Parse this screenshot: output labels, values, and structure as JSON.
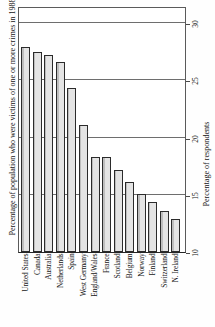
{
  "chart_data": {
    "type": "bar",
    "title": "",
    "subtitle": "",
    "categories": [
      "United States",
      "Canada",
      "Australia",
      "Netherlands",
      "Spain",
      "West Germany",
      "England/Wales",
      "France",
      "Scotland",
      "Belgium",
      "Norway",
      "Finland",
      "Switzerland",
      "N. Ireland"
    ],
    "values": [
      27.9,
      27.5,
      27.2,
      26.6,
      24.3,
      21.1,
      18.3,
      18.3,
      17.2,
      16.1,
      15.1,
      14.4,
      13.6,
      12.9
    ],
    "xlabel": "",
    "ylabel": "Percentage of population who were victims of one or more crimes in 1988",
    "ylabel_right": "Percentage of respondents",
    "ylim": [
      10,
      31.5
    ],
    "yticks": [
      10,
      15,
      20,
      25,
      30
    ],
    "ytick_labels": [
      "10",
      "15",
      "20",
      "25",
      "30"
    ],
    "gridlines": [
      15,
      20,
      25,
      30
    ],
    "grid": true,
    "legend": "none",
    "bar_fill": "#d6d6d6",
    "bar_edge": "#2b2b2b",
    "axis_color": "#4a4a4a",
    "orientation": "vertical"
  },
  "axis_titles": {
    "left": "Percentage of population who were victims of one or more crimes in 1988",
    "right": "Percentage of respondents"
  }
}
